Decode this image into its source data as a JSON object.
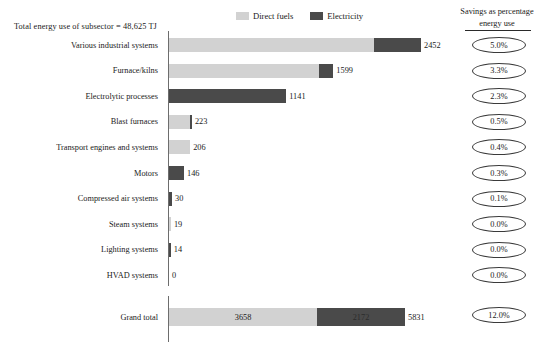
{
  "header": {
    "subsector_total": "Total energy use of subsector = 48,625 TJ",
    "savings_title_line1": "Savings as percentage",
    "savings_title_line2": "energy use"
  },
  "legend": {
    "items": [
      {
        "label": "Direct fuels",
        "color": "#d2d2d2",
        "icon": "legend-swatch-direct-fuels"
      },
      {
        "label": "Electricity",
        "color": "#4a4a4a",
        "icon": "legend-swatch-electricity"
      }
    ]
  },
  "colors": {
    "direct_fuels": "#d2d2d2",
    "electricity": "#4a4a4a",
    "axis": "#6d6d6d",
    "text": "#1a1a1a"
  },
  "chart_data": {
    "type": "bar",
    "title": "Total energy use of subsector = 48,625 TJ",
    "subtitle": "Savings as percentage energy use",
    "orientation": "horizontal",
    "stacked": true,
    "xlabel": "",
    "ylabel": "",
    "unit": "TJ",
    "xlim": [
      0,
      2452
    ],
    "grid": false,
    "legend_position": "top-center",
    "categories": [
      "Various industrial systems",
      "Furnace/kilns",
      "Electrolytic processes",
      "Blast furnaces",
      "Transport engines and systems",
      "Motors",
      "Compressed air systems",
      "Steam systems",
      "Lighting systems",
      "HVAD systems"
    ],
    "series": [
      {
        "name": "Direct fuels",
        "color": "#d2d2d2",
        "values": [
          1990,
          1460,
          0,
          202,
          206,
          0,
          0,
          19,
          0,
          0
        ]
      },
      {
        "name": "Electricity",
        "color": "#4a4a4a",
        "values": [
          462,
          139,
          1141,
          21,
          0,
          146,
          30,
          0,
          14,
          0
        ]
      }
    ],
    "totals": [
      2452,
      1599,
      1141,
      223,
      206,
      146,
      30,
      19,
      14,
      0
    ],
    "savings_percent": [
      "5.0%",
      "3.3%",
      "2.3%",
      "0.5%",
      "0.4%",
      "0.3%",
      "0.1%",
      "0.0%",
      "0.0%",
      "0.0%"
    ],
    "grand_total": {
      "label": "Grand total",
      "direct_fuels": 3658,
      "electricity": 2172,
      "total": 5831,
      "savings_percent": "12.0%"
    }
  },
  "rows": [
    {
      "label": "Various industrial systems",
      "fuels": 1990,
      "elec": 462,
      "total": "2452",
      "savings": "5.0%"
    },
    {
      "label": "Furnace/kilns",
      "fuels": 1460,
      "elec": 139,
      "total": "1599",
      "savings": "3.3%"
    },
    {
      "label": "Electrolytic processes",
      "fuels": 0,
      "elec": 1141,
      "total": "1141",
      "savings": "2.3%"
    },
    {
      "label": "Blast furnaces",
      "fuels": 202,
      "elec": 21,
      "total": "223",
      "savings": "0.5%"
    },
    {
      "label": "Transport engines and systems",
      "fuels": 206,
      "elec": 0,
      "total": "206",
      "savings": "0.4%"
    },
    {
      "label": "Motors",
      "fuels": 0,
      "elec": 146,
      "total": "146",
      "savings": "0.3%"
    },
    {
      "label": "Compressed air systems",
      "fuels": 0,
      "elec": 30,
      "total": "30",
      "savings": "0.1%"
    },
    {
      "label": "Steam systems",
      "fuels": 19,
      "elec": 0,
      "total": "19",
      "savings": "0.0%"
    },
    {
      "label": "Lighting systems",
      "fuels": 0,
      "elec": 14,
      "total": "14",
      "savings": "0.0%"
    },
    {
      "label": "HVAD systems",
      "fuels": 0,
      "elec": 0,
      "total": "0",
      "savings": "0.0%"
    }
  ],
  "grand_total_row": {
    "label": "Grand total",
    "fuels": 3658,
    "elec": 2172,
    "fuels_text": "3658",
    "elec_text": "2172",
    "total_text": "5831",
    "savings": "12.0%"
  }
}
